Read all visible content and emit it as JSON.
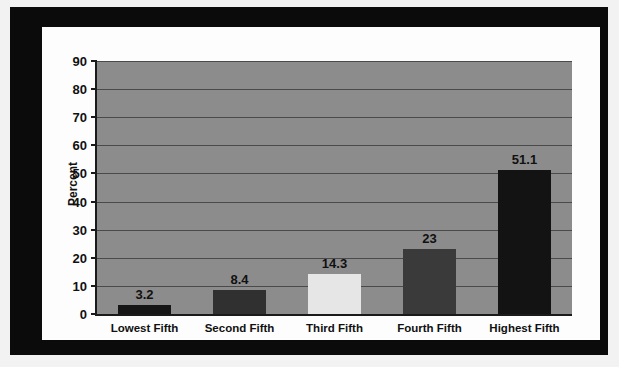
{
  "chart_data": {
    "type": "bar",
    "title": "",
    "xlabel": "",
    "ylabel": "Percent",
    "ylim": [
      0,
      90
    ],
    "ytick_step": 10,
    "yticks": [
      "90",
      "80",
      "70",
      "60",
      "50",
      "40",
      "30",
      "20",
      "10",
      "0"
    ],
    "grid": true,
    "legend": "none",
    "categories": [
      "Lowest Fifth",
      "Second Fifth",
      "Third Fifth",
      "Fourth Fifth",
      "Highest Fifth"
    ],
    "values": [
      3.2,
      8.4,
      14.3,
      23,
      51.1
    ],
    "value_labels": [
      "3.2",
      "8.4",
      "14.3",
      "23",
      "51.1"
    ],
    "bar_colors": [
      "#161616",
      "#303030",
      "#e6e6e6",
      "#3a3a3a",
      "#131313"
    ],
    "plot_background": "#8c8c8c",
    "gridline_color": "#4a4a4a",
    "axis_color": "#1a1a1a",
    "card_background": "#fdfdfd",
    "frame_color": "#0b0b0b"
  }
}
